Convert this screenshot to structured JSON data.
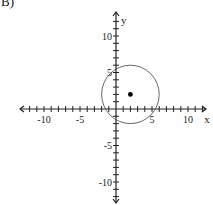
{
  "problem_label": "B)",
  "chart_data": {
    "type": "scatter",
    "title": "",
    "xlabel": "x",
    "ylabel": "y",
    "xlim": [
      -12,
      12
    ],
    "ylim": [
      -12,
      12
    ],
    "grid": false,
    "x_tick_labels": [
      "-10",
      "-5",
      "5",
      "10"
    ],
    "y_tick_labels": [
      "10",
      "5",
      "-5",
      "-10"
    ],
    "tick_step": 1,
    "shapes": [
      {
        "kind": "circle",
        "center": [
          2,
          2
        ],
        "radius": 4,
        "style": "thin outline"
      }
    ],
    "points": [
      {
        "x": 2,
        "y": 2,
        "label": "center"
      }
    ]
  },
  "colors": {
    "axis": "#222222",
    "circle": "#555555",
    "point": "#000000"
  }
}
